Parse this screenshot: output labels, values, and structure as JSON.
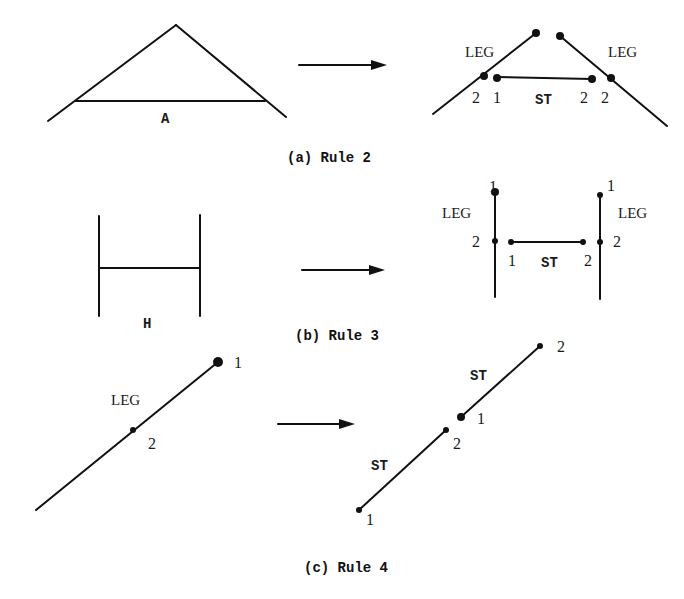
{
  "colors": {
    "ink": "#111111",
    "background": "#ffffff"
  },
  "panels": [
    {
      "id": "a",
      "caption": "(a) Rule 2",
      "input": {
        "shape_label": "A",
        "lines": [
          [
            48,
            121,
            176,
            25
          ],
          [
            176,
            25,
            286,
            117
          ],
          [
            75,
            101,
            265,
            101
          ]
        ]
      },
      "output": {
        "lines": [
          [
            433,
            114,
            536,
            33
          ],
          [
            560,
            36,
            667,
            126
          ],
          [
            497,
            77,
            592,
            79
          ]
        ],
        "dots": [
          [
            536,
            33,
            4
          ],
          [
            560,
            36,
            4
          ],
          [
            484,
            76,
            4
          ],
          [
            497,
            78,
            4
          ],
          [
            592,
            79,
            4
          ],
          [
            611,
            78,
            4
          ]
        ],
        "labels": [
          {
            "text": "LEG",
            "x": 465,
            "y": 57,
            "cls": "lbl-serif"
          },
          {
            "text": "LEG",
            "x": 608,
            "y": 57,
            "cls": "lbl-serif"
          },
          {
            "text": "2",
            "x": 472,
            "y": 103,
            "cls": "lbl-num"
          },
          {
            "text": "1",
            "x": 493,
            "y": 103,
            "cls": "lbl-num"
          },
          {
            "text": "ST",
            "x": 535,
            "y": 104,
            "cls": "lbl-mono"
          },
          {
            "text": "2",
            "x": 580,
            "y": 103,
            "cls": "lbl-num"
          },
          {
            "text": "2",
            "x": 601,
            "y": 103,
            "cls": "lbl-num"
          }
        ]
      },
      "arrow": [
        299,
        65,
        387,
        65
      ],
      "caption_pos": [
        287,
        162
      ]
    },
    {
      "id": "b",
      "caption": "(b) Rule 3",
      "input": {
        "shape_label": "H",
        "lines": [
          [
            99,
            216,
            99,
            316
          ],
          [
            200,
            215,
            200,
            316
          ],
          [
            99,
            268,
            199,
            268
          ]
        ]
      },
      "output": {
        "lines": [
          [
            495,
            191,
            495,
            297
          ],
          [
            600,
            195,
            600,
            299
          ],
          [
            511,
            242,
            583,
            242
          ]
        ],
        "dots": [
          [
            495,
            192,
            4
          ],
          [
            495,
            241,
            3
          ],
          [
            511,
            242,
            3
          ],
          [
            583,
            242,
            3
          ],
          [
            600,
            195,
            3
          ],
          [
            600,
            242,
            3
          ]
        ],
        "labels": [
          {
            "text": "1",
            "x": 489,
            "y": 192,
            "cls": "lbl-num"
          },
          {
            "text": "LEG",
            "x": 442,
            "y": 218,
            "cls": "lbl-serif"
          },
          {
            "text": "2",
            "x": 472,
            "y": 247,
            "cls": "lbl-num"
          },
          {
            "text": "1",
            "x": 508,
            "y": 266,
            "cls": "lbl-num"
          },
          {
            "text": "ST",
            "x": 541,
            "y": 267,
            "cls": "lbl-mono"
          },
          {
            "text": "2",
            "x": 584,
            "y": 266,
            "cls": "lbl-num"
          },
          {
            "text": "1",
            "x": 607,
            "y": 191,
            "cls": "lbl-num"
          },
          {
            "text": "LEG",
            "x": 618,
            "y": 218,
            "cls": "lbl-serif"
          },
          {
            "text": "2",
            "x": 613,
            "y": 247,
            "cls": "lbl-num"
          }
        ]
      },
      "arrow": [
        302,
        270,
        385,
        270
      ],
      "caption_pos": [
        295,
        340
      ]
    },
    {
      "id": "c",
      "caption": "(c) Rule 4",
      "input": {
        "shape_label": "",
        "lines": [
          [
            36,
            510,
            218,
            362
          ]
        ],
        "dots": [
          [
            218,
            362,
            5
          ],
          [
            133,
            430,
            3
          ]
        ],
        "labels": [
          {
            "text": "1",
            "x": 234,
            "y": 368,
            "cls": "lbl-num"
          },
          {
            "text": "LEG",
            "x": 111,
            "y": 405,
            "cls": "lbl-serif"
          },
          {
            "text": "2",
            "x": 148,
            "y": 449,
            "cls": "lbl-num"
          }
        ]
      },
      "output": {
        "lines": [
          [
            359,
            510,
            446,
            430
          ],
          [
            461,
            417,
            540,
            346
          ]
        ],
        "dots": [
          [
            359,
            510,
            3
          ],
          [
            446,
            430,
            3
          ],
          [
            461,
            417,
            4
          ],
          [
            540,
            346,
            3
          ]
        ],
        "labels": [
          {
            "text": "2",
            "x": 557,
            "y": 352,
            "cls": "lbl-num"
          },
          {
            "text": "ST",
            "x": 470,
            "y": 380,
            "cls": "lbl-mono"
          },
          {
            "text": "1",
            "x": 477,
            "y": 424,
            "cls": "lbl-num"
          },
          {
            "text": "2",
            "x": 453,
            "y": 449,
            "cls": "lbl-num"
          },
          {
            "text": "ST",
            "x": 371,
            "y": 470,
            "cls": "lbl-mono"
          },
          {
            "text": "1",
            "x": 366,
            "y": 525,
            "cls": "lbl-num"
          }
        ]
      },
      "arrow": [
        278,
        424,
        355,
        424
      ],
      "caption_pos": [
        304,
        572
      ]
    }
  ]
}
